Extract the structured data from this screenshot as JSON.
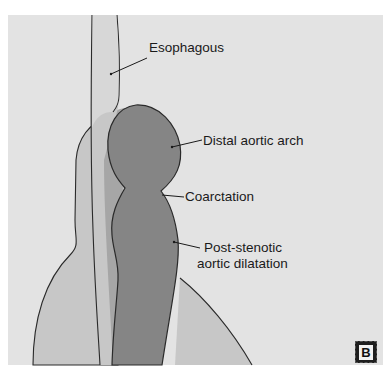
{
  "figure": {
    "panel_letter": "B",
    "colors": {
      "background": "#e3e3e3",
      "outer_region": "#c7c7c7",
      "middle_region": "#a6a6a6",
      "aorta": "#858585",
      "outline": "#2a2a2a"
    },
    "labels": {
      "esophagus": "Esophagous",
      "distal_arch": "Distal aortic arch",
      "coarctation": "Coarctation",
      "post_stenotic_line1": "Post-stenotic",
      "post_stenotic_line2": "aortic dilatation"
    }
  }
}
